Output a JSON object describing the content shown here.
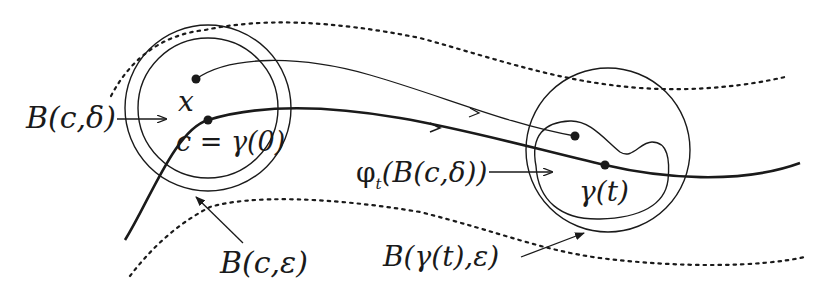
{
  "figure": {
    "labels": {
      "ball_delta": "B(c,δ)",
      "point_x": "x",
      "center_c": "c = γ(0)",
      "ball_eps": "B(c,ε)",
      "flow_image": "φ",
      "flow_image_sub": "t",
      "flow_image_arg": "(B(c,δ))",
      "gamma_t": "γ(t)",
      "ball_gamma_eps": "B(γ(t),ε)"
    },
    "colors": {
      "ink": "#1a1a1a",
      "background": "#ffffff",
      "bleed_text": "#eeeeee"
    }
  }
}
